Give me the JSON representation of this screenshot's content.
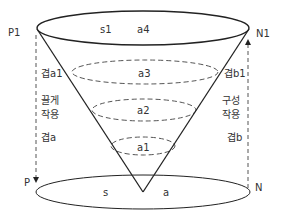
{
  "diagram": {
    "colors": {
      "stroke": "#222222",
      "dashed": "#666666",
      "text": "#333333",
      "background": "#ffffff"
    },
    "points": {
      "top_left": "P1",
      "top_right": "N1",
      "bottom_left": "P",
      "bottom_right": "N"
    },
    "top_ellipse": {
      "left_label": "s1",
      "right_label": "a4"
    },
    "bottom_ellipse": {
      "left_label": "s",
      "right_label": "a"
    },
    "layers": [
      {
        "label": "a3"
      },
      {
        "label": "a2"
      },
      {
        "label": "a1"
      }
    ],
    "left_side": {
      "upper_label": "겹a1",
      "action_line1": "끌게",
      "action_line2": "작용",
      "lower_label": "겹a",
      "arrow_direction": "down"
    },
    "right_side": {
      "upper_label": "겹b1",
      "action_line1": "구성",
      "action_line2": "작용",
      "lower_label": "겹b",
      "arrow_direction": "up"
    }
  }
}
